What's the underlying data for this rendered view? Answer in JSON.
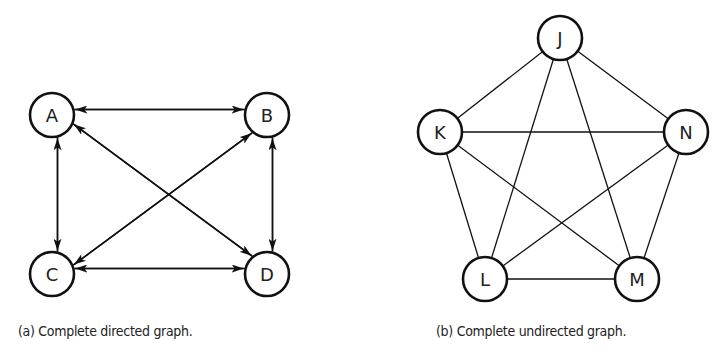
{
  "figure": {
    "panel_a": {
      "caption": "(a) Complete directed graph.",
      "type": "directed",
      "nodes": [
        {
          "id": "A",
          "label": "A",
          "x": 52,
          "y": 115
        },
        {
          "id": "B",
          "label": "B",
          "x": 267,
          "y": 115
        },
        {
          "id": "C",
          "label": "C",
          "x": 52,
          "y": 274
        },
        {
          "id": "D",
          "label": "D",
          "x": 267,
          "y": 274
        }
      ],
      "edges": [
        [
          "A",
          "B"
        ],
        [
          "B",
          "A"
        ],
        [
          "C",
          "D"
        ],
        [
          "D",
          "C"
        ],
        [
          "A",
          "C"
        ],
        [
          "C",
          "A"
        ],
        [
          "B",
          "D"
        ],
        [
          "D",
          "B"
        ],
        [
          "A",
          "D"
        ],
        [
          "D",
          "A"
        ],
        [
          "B",
          "C"
        ],
        [
          "C",
          "B"
        ]
      ]
    },
    "panel_b": {
      "caption": "(b) Complete undirected graph.",
      "type": "undirected",
      "nodes": [
        {
          "id": "J",
          "label": "J",
          "x": 560,
          "y": 38
        },
        {
          "id": "K",
          "label": "K",
          "x": 440,
          "y": 132
        },
        {
          "id": "N",
          "label": "N",
          "x": 686,
          "y": 132
        },
        {
          "id": "L",
          "label": "L",
          "x": 485,
          "y": 279
        },
        {
          "id": "M",
          "label": "M",
          "x": 637,
          "y": 279
        }
      ],
      "edges": [
        [
          "J",
          "K"
        ],
        [
          "J",
          "N"
        ],
        [
          "J",
          "L"
        ],
        [
          "J",
          "M"
        ],
        [
          "K",
          "N"
        ],
        [
          "K",
          "L"
        ],
        [
          "K",
          "M"
        ],
        [
          "N",
          "L"
        ],
        [
          "N",
          "M"
        ],
        [
          "L",
          "M"
        ]
      ]
    },
    "style": {
      "node_radius": 22,
      "stroke": "#111111",
      "node_fill": "#ffffff"
    }
  }
}
